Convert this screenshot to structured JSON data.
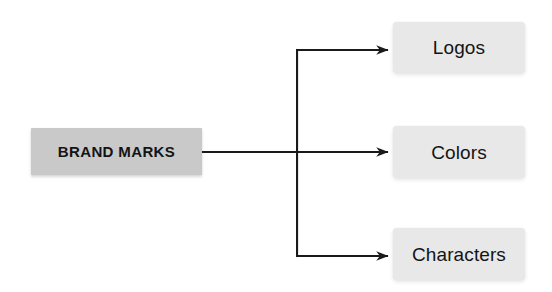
{
  "diagram": {
    "type": "tree",
    "orientation": "left-to-right",
    "background_color": "#ffffff",
    "line_color": "#1a1a1a",
    "root": {
      "id": "brand-marks",
      "label": "BRAND MARKS",
      "fill_color": "#c9c9c9",
      "text_color": "#141414",
      "x": 31,
      "y": 128,
      "width": 171,
      "height": 47
    },
    "children": [
      {
        "id": "logos",
        "label": "Logos",
        "fill_color": "#e8e8e8",
        "text_color": "#141414",
        "x": 393,
        "y": 22,
        "width": 132,
        "height": 51
      },
      {
        "id": "colors",
        "label": "Colors",
        "fill_color": "#e8e8e8",
        "text_color": "#141414",
        "x": 393,
        "y": 126,
        "width": 132,
        "height": 52
      },
      {
        "id": "characters",
        "label": "Characters",
        "fill_color": "#e8e8e8",
        "text_color": "#141414",
        "x": 393,
        "y": 228,
        "width": 132,
        "height": 52
      }
    ],
    "connectors": {
      "trunk_x": 297,
      "root_exit_x": 202,
      "branch_y": [
        50,
        152,
        256
      ],
      "arrow_tip_x": 389
    }
  }
}
